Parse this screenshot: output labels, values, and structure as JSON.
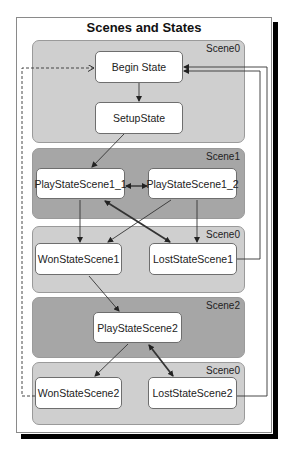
{
  "title": "Scenes and States",
  "colors": {
    "scene_light": "#cfcfcf",
    "scene_dark": "#a6a6a6",
    "state_fill": "#ffffff",
    "line": "#333333",
    "shadow": "#000000"
  },
  "scenes": [
    {
      "label": "Scene0",
      "shade": "light"
    },
    {
      "label": "Scene1",
      "shade": "dark"
    },
    {
      "label": "Scene0",
      "shade": "light"
    },
    {
      "label": "Scene2",
      "shade": "dark"
    },
    {
      "label": "Scene0",
      "shade": "light"
    }
  ],
  "states": {
    "begin": "Begin State",
    "setup": "SetupState",
    "play1_1": "PlayStateScene1_1",
    "play1_2": "PlayStateScene1_2",
    "won1": "WonStateScene1",
    "lost1": "LostStateScene1",
    "play2": "PlayStateScene2",
    "won2": "WonStateScene2",
    "lost2": "LostStateScene2"
  },
  "transitions": [
    {
      "from": "Begin State",
      "to": "SetupState",
      "type": "arrow"
    },
    {
      "from": "SetupState",
      "to": "PlayStateScene1_1",
      "type": "arrow"
    },
    {
      "from": "PlayStateScene1_1",
      "to": "PlayStateScene1_2",
      "type": "bidirectional"
    },
    {
      "from": "PlayStateScene1_1",
      "to": "WonStateScene1",
      "type": "arrow"
    },
    {
      "from": "PlayStateScene1_2",
      "to": "WonStateScene1",
      "type": "arrow"
    },
    {
      "from": "PlayStateScene1_2",
      "to": "LostStateScene1",
      "type": "arrow"
    },
    {
      "from": "PlayStateScene1_1",
      "to": "LostStateScene1",
      "type": "bidirectional-bold"
    },
    {
      "from": "WonStateScene1",
      "to": "PlayStateScene2",
      "type": "arrow"
    },
    {
      "from": "PlayStateScene2",
      "to": "WonStateScene2",
      "type": "arrow"
    },
    {
      "from": "PlayStateScene2",
      "to": "LostStateScene2",
      "type": "bidirectional-bold"
    },
    {
      "from": "LostStateScene1",
      "to": "Begin State",
      "type": "arrow"
    },
    {
      "from": "LostStateScene2",
      "to": "Begin State",
      "type": "arrow"
    },
    {
      "from": "WonStateScene2",
      "to": "Begin State",
      "type": "dashed-arrow"
    }
  ]
}
